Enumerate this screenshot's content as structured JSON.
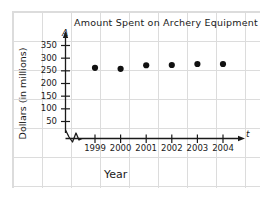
{
  "chart_data": {
    "type": "scatter",
    "title": "Amount Spent on Archery Equipment",
    "xlabel": "Year",
    "ylabel": "Dollars (in millions)",
    "x_axis_symbol": "t",
    "y_axis_symbol": "A",
    "grid": true,
    "legend": "none",
    "y_axis_break": true,
    "categories": [
      "1999",
      "2000",
      "2001",
      "2002",
      "2003",
      "2004"
    ],
    "x": [
      1999,
      2000,
      2001,
      2002,
      2003,
      2004
    ],
    "values": [
      262,
      258,
      272,
      273,
      277,
      277
    ],
    "ylim": [
      0,
      380
    ],
    "xlim": [
      1998.4,
      2005.2
    ],
    "yticks": [
      50,
      100,
      150,
      200,
      250,
      300,
      350
    ],
    "ytick_labels": [
      "50",
      "100",
      "150",
      "200",
      "250",
      "300",
      "350"
    ],
    "xtick_labels": [
      "1999",
      "2000",
      "2001",
      "2002",
      "2003",
      "2004"
    ],
    "marker": "filled-circle",
    "marker_color": "#111111",
    "axis_color": "#1a1a1a",
    "grid_color": "#dcdcdc"
  },
  "figure": {
    "background_color": "#ffffff"
  }
}
